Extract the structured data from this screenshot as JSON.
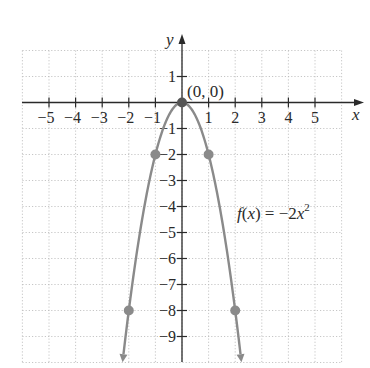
{
  "chart_data": {
    "type": "line",
    "title": "",
    "function_label": "f(x) = -2x^2",
    "xlabel": "x",
    "ylabel": "y",
    "xlim": [
      -6,
      6
    ],
    "ylim": [
      -10,
      2
    ],
    "grid": true,
    "x_ticks": [
      -5,
      -4,
      -3,
      -2,
      -1,
      1,
      2,
      3,
      4,
      5
    ],
    "y_ticks": [
      1,
      -1,
      -2,
      -3,
      -4,
      -5,
      -6,
      -7,
      -8,
      -9
    ],
    "series": [
      {
        "name": "f(x) = -2x^2",
        "x": [
          -2,
          -1,
          0,
          1,
          2
        ],
        "y": [
          -8,
          -2,
          0,
          -2,
          -8
        ],
        "color": "#8a8a8a"
      }
    ],
    "annotations": [
      {
        "text": "(0, 0)",
        "x": 0,
        "y": 0
      }
    ]
  },
  "labels": {
    "x_axis": "x",
    "y_axis": "y",
    "vertex": "(0, 0)",
    "func_prefix": "f",
    "func_mid": "(",
    "func_var": "x",
    "func_rest": ") = −2",
    "func_var2": "x",
    "func_exp": "2",
    "x_tick_labels": [
      "−5",
      "−4",
      "−3",
      "−2",
      "−1",
      "1",
      "2",
      "3",
      "4",
      "5"
    ],
    "y_tick_labels": [
      "1",
      "−1",
      "−2",
      "−3",
      "−4",
      "−5",
      "−6",
      "−7",
      "−8",
      "−9"
    ]
  }
}
